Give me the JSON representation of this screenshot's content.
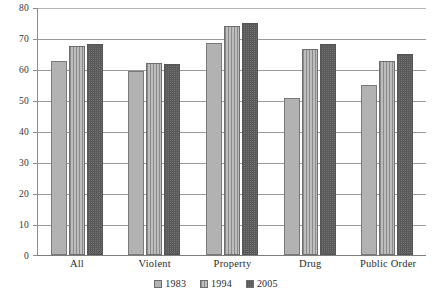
{
  "chart_data": {
    "type": "bar",
    "title": "",
    "subtitle": "",
    "xlabel": "",
    "ylabel": "",
    "categories": [
      "All",
      "Violent",
      "Property",
      "Drug",
      "Public Order"
    ],
    "series": [
      {
        "name": "1983",
        "values": [
          62.5,
          59.5,
          68.5,
          50.5,
          55.0
        ],
        "pattern": "solid-light-gray",
        "color": "#b2b2b2"
      },
      {
        "name": "1994",
        "values": [
          67.5,
          62.0,
          74.0,
          66.5,
          62.5
        ],
        "pattern": "vertical-stripes",
        "color": "#9d9d9d"
      },
      {
        "name": "2005",
        "values": [
          68.0,
          61.5,
          75.0,
          68.0,
          65.0
        ],
        "pattern": "checkerboard-dark",
        "color": "#6f6f6f"
      }
    ],
    "ylim": [
      0,
      80
    ],
    "yticks": [
      0,
      10,
      20,
      30,
      40,
      50,
      60,
      70,
      80
    ],
    "ytick_labels": [
      "0",
      "10",
      "20",
      "30",
      "40",
      "50",
      "60",
      "70",
      "80"
    ],
    "grid": true,
    "grid_axis": "y",
    "legend_position": "bottom-center",
    "legend": [
      "1983",
      "1994",
      "2005"
    ]
  }
}
